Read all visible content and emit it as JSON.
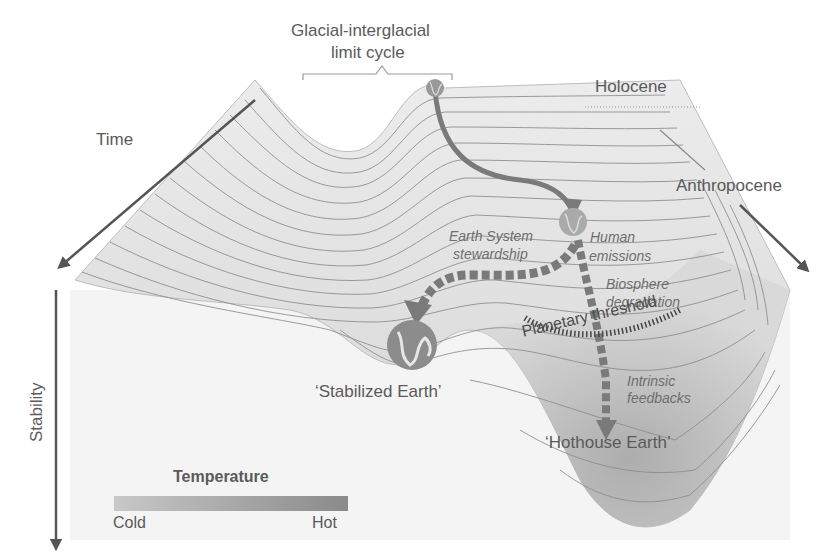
{
  "diagram": {
    "title_bracket_label_line1": "Glacial-interglacial",
    "title_bracket_label_line2": "limit cycle",
    "labels": {
      "holocene": "Holocene",
      "anthropocene": "Anthropocene",
      "time": "Time",
      "stability": "Stability",
      "earth_system_stewardship_line1": "Earth System",
      "earth_system_stewardship_line2": "stewardship",
      "human_emissions_line1": "Human",
      "human_emissions_line2": "emissions",
      "biosphere_degradation_line1": "Biosphere",
      "biosphere_degradation_line2": "degradation",
      "planetary_threshold": "Planetary threshold",
      "intrinsic_feedbacks_line1": "Intrinsic",
      "intrinsic_feedbacks_line2": "feedbacks",
      "stabilized_earth": "‘Stabilized Earth’",
      "hothouse_earth": "‘Hothouse Earth’"
    },
    "legend": {
      "title": "Temperature",
      "min_label": "Cold",
      "max_label": "Hot",
      "gradient_from": "#c8c8c8",
      "gradient_to": "#8a8a8a"
    },
    "colors": {
      "surface_light": "#e9e9e9",
      "surface_dark": "#a9a9a9",
      "contour": "#8c8c8c",
      "arrow": "#7a7a7a",
      "axis": "#555555",
      "text": "#5a5a5a"
    },
    "nodes": [
      {
        "id": "holocene-earth",
        "icon": "globe-icon"
      },
      {
        "id": "anthropocene-earth",
        "icon": "globe-icon"
      },
      {
        "id": "stabilized-earth",
        "icon": "globe-icon"
      }
    ],
    "pathways": [
      {
        "from": "holocene",
        "to": "anthropocene",
        "style": "solid"
      },
      {
        "from": "anthropocene",
        "to": "stabilized-earth",
        "style": "dashed",
        "label": "Earth System stewardship"
      },
      {
        "from": "anthropocene",
        "to": "hothouse-earth",
        "style": "dashed",
        "label": "Human emissions / Biosphere degradation / Intrinsic feedbacks"
      }
    ]
  }
}
